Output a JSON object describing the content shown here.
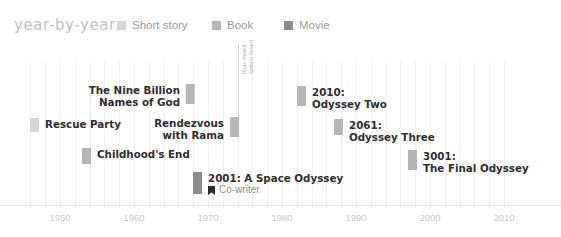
{
  "header": {
    "title": "year-by-year"
  },
  "legend": {
    "items": [
      {
        "label": "Short story",
        "color": "#d5d5d5",
        "x": 117
      },
      {
        "label": "Book",
        "color": "#b6b6b6",
        "x": 212
      },
      {
        "label": "Movie",
        "color": "#8a8a8a",
        "x": 284
      }
    ]
  },
  "axis": {
    "ticklabels": [
      "1950",
      "1960",
      "1970",
      "1980",
      "1990",
      "2000",
      "2010"
    ],
    "tickvalues": [
      1950,
      1960,
      1970,
      1980,
      1990,
      2000,
      2010
    ],
    "minor_tick_step": 2
  },
  "annotation": {
    "award_labels": [
      "Hugo Award",
      "Nebula Award"
    ]
  },
  "entries": [
    {
      "title": "Rescue Party",
      "sub": "",
      "type": "Short story",
      "year": 1946,
      "align": "right"
    },
    {
      "title": "Childhood's End",
      "sub": "",
      "type": "Book",
      "year": 1953,
      "align": "right"
    },
    {
      "title": "The Nine Billion\nNames of God",
      "sub": "",
      "type": "Book",
      "year": 1967,
      "align": "left"
    },
    {
      "title": "Rendezvous\nwith Rama",
      "sub": "",
      "type": "Book",
      "year": 1973,
      "align": "left"
    },
    {
      "title": "2001: A Space Odyssey",
      "sub": "Co-writer",
      "type": "Movie",
      "year": 1968,
      "align": "right"
    },
    {
      "title": "2010:\nOdyssey Two",
      "sub": "",
      "type": "Book",
      "year": 1982,
      "align": "right"
    },
    {
      "title": "2061:\nOdyssey Three",
      "sub": "",
      "type": "Book",
      "year": 1987,
      "align": "right"
    },
    {
      "title": "3001:\nThe Final Odyssey",
      "sub": "",
      "type": "Book",
      "year": 1997,
      "align": "right"
    }
  ],
  "chart_data": {
    "type": "timeline",
    "title": "year-by-year",
    "xlabel": "",
    "ylabel": "",
    "xlim": [
      1944,
      2012
    ],
    "grid": true,
    "legend_position": "top",
    "categories": [
      "Short story",
      "Book",
      "Movie"
    ],
    "category_colors": {
      "Short story": "#d5d5d5",
      "Book": "#b6b6b6",
      "Movie": "#8a8a8a"
    },
    "points": [
      {
        "label": "Rescue Party",
        "year": 1946,
        "type": "Short story",
        "awards": []
      },
      {
        "label": "Childhood's End",
        "year": 1953,
        "type": "Book",
        "awards": []
      },
      {
        "label": "The Nine Billion Names of God",
        "year": 1967,
        "type": "Book",
        "awards": []
      },
      {
        "label": "2001: A Space Odyssey",
        "year": 1968,
        "type": "Movie",
        "awards": [],
        "note": "Co-writer"
      },
      {
        "label": "Rendezvous with Rama",
        "year": 1973,
        "type": "Book",
        "awards": [
          "Hugo Award",
          "Nebula Award"
        ]
      },
      {
        "label": "2010: Odyssey Two",
        "year": 1982,
        "type": "Book",
        "awards": []
      },
      {
        "label": "2061: Odyssey Three",
        "year": 1987,
        "type": "Book",
        "awards": []
      },
      {
        "label": "3001: The Final Odyssey",
        "year": 1997,
        "type": "Book",
        "awards": []
      }
    ]
  }
}
